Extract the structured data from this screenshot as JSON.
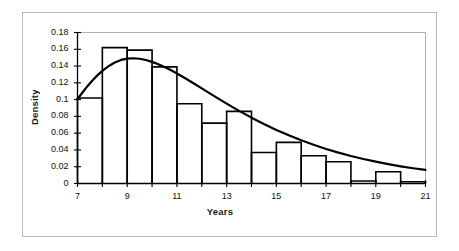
{
  "figure": {
    "border_color": "#b9b9b9",
    "background": "#ffffff"
  },
  "axes": {
    "ylabel": "Density",
    "xlabel": "Years",
    "ytick_labels": [
      "0.18",
      "0.16",
      "0.14",
      "0.12",
      "0.1",
      "0.08",
      "0.06",
      "0.04",
      "0.02",
      "0"
    ],
    "xtick_labels": [
      "7",
      "9",
      "11",
      "13",
      "15",
      "17",
      "19",
      "21"
    ]
  },
  "chart_data": {
    "type": "bar",
    "title": "",
    "xlabel": "Years",
    "ylabel": "Density",
    "xlim": [
      7,
      21
    ],
    "ylim": [
      0,
      0.18
    ],
    "grid": false,
    "legend": null,
    "bin_width": 1,
    "bin_edges": [
      7,
      8,
      9,
      10,
      11,
      12,
      13,
      14,
      15,
      16,
      17,
      18,
      19,
      20,
      21
    ],
    "categories": [
      "7-8",
      "8-9",
      "9-10",
      "10-11",
      "11-12",
      "12-13",
      "13-14",
      "14-15",
      "15-16",
      "16-17",
      "17-18",
      "18-19",
      "19-20",
      "20-21"
    ],
    "values": [
      0.102,
      0.162,
      0.159,
      0.139,
      0.095,
      0.072,
      0.086,
      0.037,
      0.049,
      0.033,
      0.026,
      0.003,
      0.014,
      0.002
    ],
    "ytick_values": [
      0.18,
      0.16,
      0.14,
      0.12,
      0.1,
      0.08,
      0.06,
      0.04,
      0.02,
      0
    ],
    "xtick_values": [
      7,
      9,
      11,
      13,
      15,
      17,
      19,
      21
    ],
    "xtick_minor_values": [
      7,
      8,
      9,
      10,
      11,
      12,
      13,
      14,
      15,
      16,
      17,
      18,
      19,
      20,
      21
    ],
    "bar_style": {
      "fill": "none",
      "edge_color": "#000000",
      "edge_width": 1.6
    },
    "overlay_curve": {
      "name": "fitted density curve",
      "style": {
        "color": "#000000",
        "width": 2.2,
        "fill": "none"
      },
      "x": [
        7.0,
        7.2,
        7.4,
        7.6,
        7.8,
        8.0,
        8.25,
        8.5,
        8.75,
        9.0,
        9.25,
        9.5,
        9.75,
        10.0,
        10.25,
        10.5,
        10.75,
        11.0,
        11.25,
        11.5,
        11.75,
        12.0,
        12.5,
        13.0,
        13.5,
        14.0,
        14.5,
        15.0,
        15.5,
        16.0,
        16.5,
        17.0,
        17.5,
        18.0,
        18.5,
        19.0,
        19.5,
        20.0,
        20.5,
        21.0
      ],
      "y": [
        0.1005,
        0.1085,
        0.116,
        0.1228,
        0.1289,
        0.1343,
        0.1399,
        0.1443,
        0.1473,
        0.1489,
        0.1493,
        0.1487,
        0.1472,
        0.145,
        0.1422,
        0.1389,
        0.1352,
        0.1312,
        0.1269,
        0.1225,
        0.118,
        0.1134,
        0.1042,
        0.0952,
        0.0866,
        0.0785,
        0.0709,
        0.0639,
        0.0574,
        0.0515,
        0.0461,
        0.0412,
        0.0368,
        0.0328,
        0.0292,
        0.026,
        0.0231,
        0.0205,
        0.0182,
        0.0162
      ]
    }
  }
}
